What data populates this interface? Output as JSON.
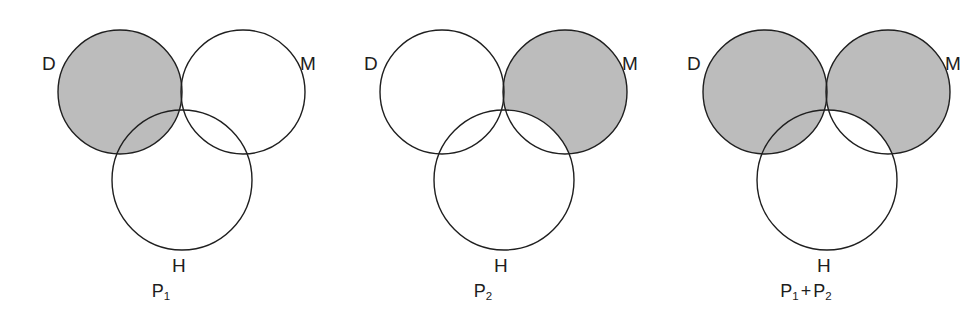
{
  "figure": {
    "background": "#ffffff",
    "stroke_color": "#1f1f1f",
    "shade_color": "#bcbcbc",
    "stroke_width": 1.4,
    "width": 967,
    "height": 324
  },
  "geometry": {
    "circle_radius": 62,
    "h_radius": 70,
    "d_center": [
      120,
      92
    ],
    "m_center": [
      243,
      92
    ],
    "h_center": [
      182,
      180
    ]
  },
  "panels": [
    {
      "id": "p1",
      "caption": {
        "base": "P",
        "sub": "1",
        "full": "P1"
      },
      "labels": {
        "d": "D",
        "m": "M",
        "h": "H"
      },
      "shaded_description": "D minus M",
      "shaded_regions": [
        "D-only",
        "D-and-H-only"
      ]
    },
    {
      "id": "p2",
      "caption": {
        "base": "P",
        "sub": "2",
        "full": "P2"
      },
      "labels": {
        "d": "D",
        "m": "M",
        "h": "H"
      },
      "shaded_description": "M minus H",
      "shaded_regions": [
        "M-only",
        "D-and-M-only"
      ]
    },
    {
      "id": "p1-plus-p2",
      "caption": {
        "base": "P",
        "sub": "1",
        "op": "+",
        "base2": "P",
        "sub2": "2",
        "full": "P1 + P2"
      },
      "labels": {
        "d": "D",
        "m": "M",
        "h": "H"
      },
      "shaded_description": "union of (D minus M) and (M minus H)",
      "shaded_regions": [
        "D-only",
        "D-and-H-only",
        "D-and-M-only",
        "M-only"
      ]
    }
  ]
}
